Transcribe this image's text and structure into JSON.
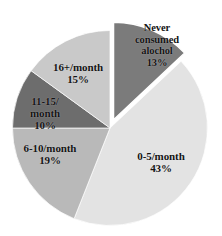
{
  "chart_data": {
    "type": "pie",
    "title": "",
    "subtitle": "",
    "xlabel": "",
    "ylabel": "",
    "legend_position": "none",
    "grid": false,
    "units": "percent",
    "total": 100,
    "start_angle_deg": 0,
    "direction": "clockwise",
    "categories": [
      "Never consumed alochol",
      "0-5/month",
      "6-10/month",
      "11-15/month",
      "16+/month"
    ],
    "values": [
      13,
      43,
      19,
      10,
      15
    ],
    "value_labels": [
      "13%",
      "43%",
      "19%",
      "10%",
      "15%"
    ],
    "colors": [
      "#7b7b7b",
      "#e3e3e3",
      "#b9b9b9",
      "#6d6d6d",
      "#c9c9c9"
    ],
    "exploded": [
      true,
      false,
      false,
      false,
      false
    ],
    "slices": [
      {
        "name": "never-consumed-alochol",
        "label_line1": "Never",
        "label_line2": "consumed",
        "label_line3": "alochol",
        "label_text": "Never\nconsumed\nalochol\n13%",
        "value": 13,
        "value_label": "13%",
        "color": "#7b7b7b",
        "exploded": true,
        "start_angle": 0,
        "end_angle": 46.8
      },
      {
        "name": "0-5-per-month",
        "label_line1": "0-5/month",
        "label_text": "0-5/month\n43%",
        "value": 43,
        "value_label": "43%",
        "color": "#e3e3e3",
        "exploded": false,
        "start_angle": 46.8,
        "end_angle": 201.6
      },
      {
        "name": "6-10-per-month",
        "label_line1": "6-10/month",
        "label_text": "6-10/month\n19%",
        "value": 19,
        "value_label": "19%",
        "color": "#b9b9b9",
        "exploded": false,
        "start_angle": 201.6,
        "end_angle": 270.0
      },
      {
        "name": "11-15-per-month",
        "label_line1": "11-15/",
        "label_line2": "month",
        "label_text": "11-15/\nmonth\n10%",
        "value": 10,
        "value_label": "10%",
        "color": "#6d6d6d",
        "exploded": false,
        "start_angle": 270.0,
        "end_angle": 306.0
      },
      {
        "name": "16-plus-per-month",
        "label_line1": "16+/month",
        "label_text": "16+/month\n15%",
        "value": 15,
        "value_label": "15%",
        "color": "#c9c9c9",
        "exploded": false,
        "start_angle": 306.0,
        "end_angle": 360.0
      }
    ]
  },
  "labels": {
    "never": "Never\nconsumed\nalochol\n13%",
    "p0_5": "0-5/month\n43%",
    "p6_10": "6-10/month\n19%",
    "p11_15": "11-15/\nmonth\n10%",
    "p16plus": "16+/month\n15%"
  }
}
